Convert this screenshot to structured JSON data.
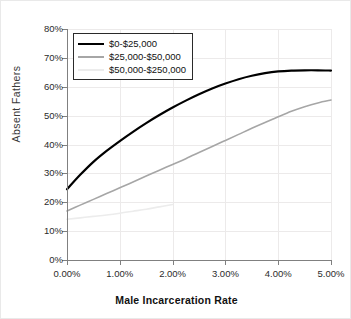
{
  "chart_data": {
    "type": "line",
    "title": "",
    "xlabel": "Male Incarceration Rate",
    "ylabel": "Absent Fathers",
    "xlim": [
      0,
      5
    ],
    "ylim": [
      0,
      80
    ],
    "grid": true,
    "legend_position": "top-left",
    "x_tick_labels": [
      "0.00%",
      "1.00%",
      "2.00%",
      "3.00%",
      "4.00%",
      "5.00%"
    ],
    "x_ticks": [
      0,
      1,
      2,
      3,
      4,
      5
    ],
    "y_tick_labels": [
      "0%",
      "10%",
      "20%",
      "30%",
      "40%",
      "50%",
      "60%",
      "70%",
      "80%"
    ],
    "y_ticks": [
      0,
      10,
      20,
      30,
      40,
      50,
      60,
      70,
      80
    ],
    "series": [
      {
        "name": "$0-$25,000",
        "color": "#000000",
        "width": 2.2,
        "x": [
          0.0,
          0.25,
          0.5,
          0.75,
          1.0,
          1.25,
          1.5,
          1.75,
          2.0,
          2.25,
          2.5,
          2.75,
          3.0,
          3.25,
          3.5,
          3.75,
          4.0,
          4.25,
          4.5,
          4.75,
          5.0
        ],
        "values": [
          24.5,
          29.5,
          34.0,
          37.8,
          41.2,
          44.4,
          47.4,
          50.2,
          52.8,
          55.2,
          57.4,
          59.4,
          61.1,
          62.6,
          63.8,
          64.7,
          65.3,
          65.6,
          65.7,
          65.7,
          65.6
        ]
      },
      {
        "name": "$25,000-$50,000",
        "color": "#a6a6a6",
        "width": 1.6,
        "x": [
          0.0,
          0.25,
          0.5,
          0.75,
          1.0,
          1.25,
          1.5,
          1.75,
          2.0,
          2.25,
          2.5,
          2.75,
          3.0,
          3.25,
          3.5,
          3.75,
          4.0,
          4.25,
          4.5,
          4.75,
          5.0
        ],
        "values": [
          17.0,
          19.0,
          21.0,
          23.0,
          25.0,
          27.0,
          29.1,
          31.1,
          33.1,
          35.1,
          37.2,
          39.3,
          41.4,
          43.5,
          45.6,
          47.6,
          49.6,
          51.5,
          53.1,
          54.4,
          55.4
        ]
      },
      {
        "name": "$50,000-$250,000",
        "color": "#ececec",
        "width": 1.6,
        "x": [
          0.0,
          0.25,
          0.5,
          0.75,
          1.0,
          1.25,
          1.5,
          1.75,
          2.0
        ],
        "values": [
          14.1,
          14.6,
          15.1,
          15.6,
          16.2,
          16.9,
          17.6,
          18.4,
          19.2
        ]
      }
    ]
  }
}
